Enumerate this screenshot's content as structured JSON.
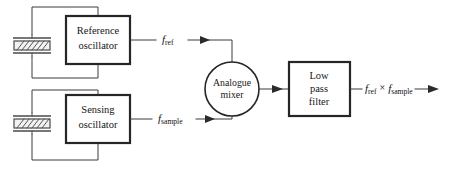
{
  "diagram": {
    "background_color": "#ffffff",
    "line_color": "#3a3a3a",
    "block_border_color": "#262626",
    "blocks": {
      "reference_oscillator": {
        "line1": "Reference",
        "line2": "oscillator"
      },
      "sensing_oscillator": {
        "line1": "Sensing",
        "line2": "oscillator"
      },
      "analogue_mixer": {
        "line1": "Analogue",
        "line2": "mixer"
      },
      "low_pass_filter": {
        "line1": "Low",
        "line2": "pass",
        "line3": "filter"
      }
    },
    "signals": {
      "reference": {
        "symbol": "f",
        "subscript": "ref"
      },
      "sample": {
        "symbol": "f",
        "subscript": "sample"
      },
      "output": {
        "symbol_a": "f",
        "subscript_a": "ref",
        "operator": "×",
        "symbol_b": "f",
        "subscript_b": "sample"
      }
    },
    "components": {
      "reference_crystal": "quartz-crystal-resonator",
      "sensing_crystal": "quartz-crystal-resonator"
    }
  }
}
